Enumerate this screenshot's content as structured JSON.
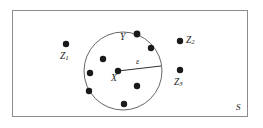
{
  "figure": {
    "type": "metric-space-epsilon-neighborhood-diagram",
    "canvas": {
      "width": 263,
      "height": 128,
      "background": "#ffffff"
    },
    "colors": {
      "outline": "#8c8c8c",
      "circle_stroke": "#555555",
      "point_fill": "#1a1a1a",
      "radius_line": "#333333",
      "label_text": "#1a1a1a"
    },
    "space": {
      "label": "S",
      "shape": "rectangle",
      "x": 12,
      "y": 10,
      "width": 236,
      "height": 107,
      "label_x": 238,
      "label_y": 110
    },
    "neighborhood": {
      "label": "ε",
      "shape": "circle",
      "cx": 123,
      "cy": 71,
      "r": 39,
      "radius_label_x": 139,
      "radius_label_y": 63,
      "radius_line": {
        "x1": 118,
        "y1": 71,
        "x2": 161,
        "y2": 66
      }
    },
    "center_point": {
      "label": "X",
      "cx": 118,
      "cy": 71,
      "r": 3.2,
      "label_x": 112,
      "label_y": 81
    },
    "inner_points": [
      {
        "name": "inner-point-1",
        "cx": 103,
        "cy": 59,
        "r": 3.2
      },
      {
        "name": "inner-point-2",
        "cx": 90,
        "cy": 73,
        "r": 3.2
      },
      {
        "name": "inner-point-3",
        "cx": 89,
        "cy": 91,
        "r": 3.2
      },
      {
        "name": "inner-point-4",
        "cx": 124,
        "cy": 104,
        "r": 3.2
      },
      {
        "name": "inner-point-5",
        "cx": 137,
        "cy": 86,
        "r": 3.2
      },
      {
        "name": "inner-point-6",
        "cx": 151,
        "cy": 48,
        "r": 3.2
      }
    ],
    "boundary_point": {
      "label": "Y",
      "cx": 137,
      "cy": 34,
      "r": 3.4,
      "label_x": 122,
      "label_y": 40
    },
    "outside_points": [
      {
        "name": "outside-point-z1",
        "label": "Z",
        "subscript": "1",
        "cx": 66,
        "cy": 44,
        "r": 3.2,
        "label_x": 60,
        "label_y": 60,
        "label_position": "below"
      },
      {
        "name": "outside-point-z2",
        "label": "Z",
        "subscript": "2",
        "cx": 180,
        "cy": 41,
        "r": 3.2,
        "label_x": 186,
        "label_y": 45,
        "label_position": "right"
      },
      {
        "name": "outside-point-z3",
        "label": "Z",
        "subscript": "3",
        "cx": 180,
        "cy": 70,
        "r": 3.2,
        "label_x": 174,
        "label_y": 87,
        "label_position": "below"
      }
    ]
  }
}
